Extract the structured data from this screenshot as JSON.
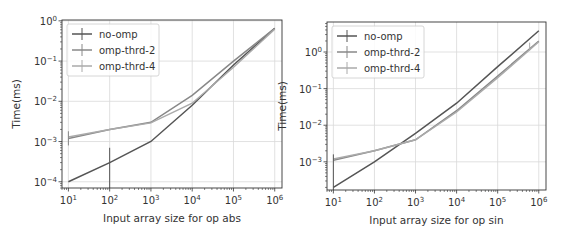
{
  "chart_data": [
    {
      "type": "line",
      "title": "",
      "xlabel": "Input array size for op abs",
      "ylabel": "Time(ms)",
      "xscale": "log",
      "yscale": "log",
      "x": [
        10,
        100,
        1000,
        10000,
        100000,
        1000000
      ],
      "xticks": [
        "10^1",
        "10^2",
        "10^3",
        "10^4",
        "10^5",
        "10^6"
      ],
      "yticks": [
        "10^-4",
        "10^-3",
        "10^-2",
        "10^-1",
        "10^0"
      ],
      "xlim": [
        7,
        1500000
      ],
      "ylim": [
        7e-05,
        1.05
      ],
      "grid": true,
      "legend_position": "upper left",
      "series": [
        {
          "name": "no-omp",
          "color": "#555555",
          "values": [
            0.0001,
            0.0003,
            0.001,
            0.008,
            0.08,
            0.65
          ]
        },
        {
          "name": "omp-thrd-2",
          "color": "#888888",
          "values": [
            0.0012,
            0.002,
            0.003,
            0.014,
            0.1,
            0.65
          ]
        },
        {
          "name": "omp-thrd-4",
          "color": "#aaaaaa",
          "values": [
            0.0013,
            0.002,
            0.0029,
            0.009,
            0.07,
            0.62
          ]
        }
      ]
    },
    {
      "type": "line",
      "title": "",
      "xlabel": "Input array size for op sin",
      "ylabel": "Time(ms)",
      "xscale": "log",
      "yscale": "log",
      "x": [
        10,
        100,
        1000,
        10000,
        100000,
        1000000
      ],
      "xticks": [
        "10^1",
        "10^2",
        "10^3",
        "10^4",
        "10^5",
        "10^6"
      ],
      "yticks": [
        "10^-3",
        "10^-2",
        "10^-1",
        "10^0"
      ],
      "xlim": [
        7,
        1500000
      ],
      "ylim": [
        0.00017,
        6.6
      ],
      "grid": true,
      "legend_position": "upper left",
      "series": [
        {
          "name": "no-omp",
          "color": "#555555",
          "values": [
            0.0002,
            0.001,
            0.006,
            0.04,
            0.4,
            3.8
          ]
        },
        {
          "name": "omp-thrd-2",
          "color": "#888888",
          "values": [
            0.0011,
            0.002,
            0.004,
            0.025,
            0.22,
            2.0
          ]
        },
        {
          "name": "omp-thrd-4",
          "color": "#aaaaaa",
          "values": [
            0.0012,
            0.002,
            0.004,
            0.023,
            0.2,
            1.9
          ]
        }
      ]
    }
  ]
}
